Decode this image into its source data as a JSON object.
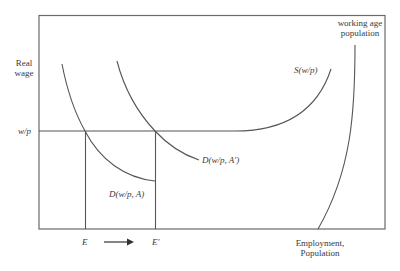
{
  "diagram": {
    "type": "labor-market-diagram",
    "axes": {
      "y_label_line1": "Real",
      "y_label_line2": "wage",
      "x_label_line1": "Employment,",
      "x_label_line2": "Population"
    },
    "wage_level_label": "w/p",
    "curves": {
      "supply": "S(w/p)",
      "demand_initial": "D(w/p, A)",
      "demand_shifted": "D(w/p, A′)",
      "population_line1": "working age",
      "population_line2": "population"
    },
    "employment_points": {
      "initial": "E",
      "shifted": "E′"
    },
    "colors": {
      "line": "#555555",
      "text": "#3a3a3a",
      "background": "#ffffff"
    }
  }
}
